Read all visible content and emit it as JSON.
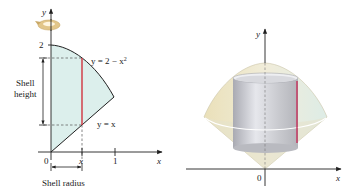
{
  "left_figure": {
    "y_axis_label": "y",
    "x_axis_label": "x",
    "origin_label": "0",
    "y_tick_label": "2",
    "x_tick_labels": [
      "x",
      "1"
    ],
    "curve_top_label": "y = 2 − x",
    "curve_top_exponent": "2",
    "curve_bottom_label": "y = x",
    "shell_height_label": [
      "Shell",
      "height"
    ],
    "shell_radius_label": "Shell radius",
    "colors": {
      "region_fill": "#dcefec",
      "shell_line": "#d0343f",
      "rotation_arrow": "#e2c68a"
    }
  },
  "right_figure": {
    "y_axis_label": "y",
    "x_axis_label": "x",
    "origin_label": "0",
    "colors": {
      "solid_left": "#ebe2bd",
      "solid_right": "#dcebe6",
      "cylinder": "#c8c9cf",
      "shell_line": "#c5305a"
    }
  }
}
